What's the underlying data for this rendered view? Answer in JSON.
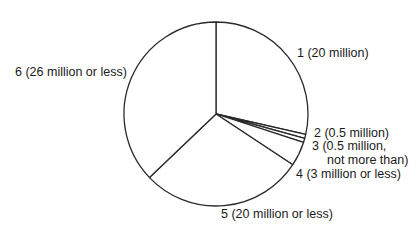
{
  "chart_data": {
    "type": "pie",
    "title": "",
    "start_angle_deg": 0,
    "direction": "clockwise",
    "total": 70,
    "slices": [
      {
        "id": "1",
        "label": "1 (20 million)",
        "value": 20
      },
      {
        "id": "2",
        "label": "2 (0.5 million)",
        "value": 0.5
      },
      {
        "id": "3",
        "label": "3 (0.5 million, not more than)",
        "value": 0.5
      },
      {
        "id": "4",
        "label": "4 (3 million or less)",
        "value": 3
      },
      {
        "id": "5",
        "label": "5 (20 million or less)",
        "value": 20
      },
      {
        "id": "6",
        "label": "6 (26 million or less)",
        "value": 26
      }
    ],
    "fill_color": "#ffffff",
    "stroke_color": "#2a2a2a",
    "legend": "none (direct labels)"
  },
  "labels": {
    "s1": "1 (20 million)",
    "s2": "2 (0.5 million)",
    "s3_line1": "3 (0.5 million,",
    "s3_line2": "not more than)",
    "s4": "4 (3 million or less)",
    "s5": "5 (20 million or less)",
    "s6": "6 (26 million or less)"
  }
}
